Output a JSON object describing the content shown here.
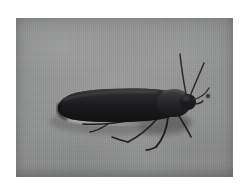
{
  "page": {
    "type": "photograph",
    "background_color": "#ffffff",
    "margin_color": "#ffffff"
  },
  "photo": {
    "name": "moth-photograph",
    "caption": "Dark grey-brown moth at rest on pale grey fabric",
    "frame": {
      "x": 16,
      "y": 18,
      "width": 217,
      "height": 159
    },
    "background": {
      "name": "fabric-background",
      "description": "woven pale grey cloth with fine vertical weave texture",
      "color": "#8f9090",
      "highlight_color": "#9a9b9a",
      "shadow_color": "#7c7d7c"
    },
    "subject": {
      "name": "moth",
      "common_name": "moth",
      "pose": "resting, wings folded tent-like over abdomen, head to the right",
      "body_color": "#1b1b1d",
      "wing_color": "#1f1f21",
      "wing_highlight_color": "#3a3a3c",
      "pale_fringe_color": "#b4b5b3",
      "parts": [
        {
          "name": "forewing",
          "color": "#1d1d1f",
          "description": "long dark elongate wing with rounded posterior tip"
        },
        {
          "name": "thorax",
          "color": "#222224",
          "description": "slightly raised dark thorax behind the head"
        },
        {
          "name": "head",
          "color": "#1a1a1c",
          "description": "small rounded head at right end"
        },
        {
          "name": "antenna-upper",
          "color": "#2a2a2c",
          "description": "long thin antenna sweeping up and slightly left"
        },
        {
          "name": "antenna-lower",
          "color": "#2a2a2c",
          "description": "second antenna sweeping up and to the right"
        },
        {
          "name": "foreleg",
          "color": "#242426",
          "description": "front leg angled down-right from thorax"
        },
        {
          "name": "midleg",
          "color": "#242426",
          "description": "middle leg angled down-left"
        },
        {
          "name": "hindleg",
          "color": "#242426",
          "description": "hind leg extending left beneath the wing"
        }
      ]
    },
    "marks": [
      {
        "name": "dark-speck",
        "x": 208,
        "y": 96,
        "size_px": 4,
        "color": "#3d3e3e",
        "description": "small dark fleck on the fabric right of the moth"
      }
    ]
  }
}
